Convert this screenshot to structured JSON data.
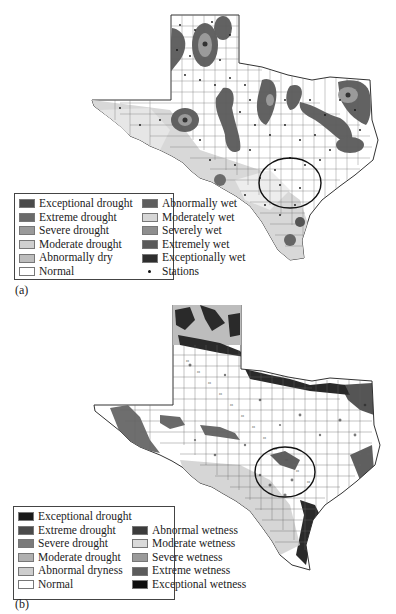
{
  "panel_a": {
    "caption": "(a)",
    "legend": {
      "left_column": [
        {
          "label": "Exceptional drought",
          "color": "#4a4a4a"
        },
        {
          "label": "Extreme drought",
          "color": "#6a6a6a"
        },
        {
          "label": "Severe drought",
          "color": "#9a9a9a"
        },
        {
          "label": "Moderate drought",
          "color": "#cfcfcf"
        },
        {
          "label": "Abnormally dry",
          "color": "#bdbdbd"
        },
        {
          "label": "Normal",
          "color": "#ffffff"
        }
      ],
      "right_column": [
        {
          "label": "Abnormally wet",
          "color": "#5e5e5e"
        },
        {
          "label": "Moderately wet",
          "color": "#d6d6d6"
        },
        {
          "label": "Severely wet",
          "color": "#8e8e8e"
        },
        {
          "label": "Extremely wet",
          "color": "#5a5a5a"
        },
        {
          "label": "Exceptionally wet",
          "color": "#2e2e2e"
        },
        {
          "label": "Stations",
          "symbol": "dot"
        }
      ]
    }
  },
  "panel_b": {
    "caption": "(b)",
    "legend": {
      "left_column": [
        {
          "label": "Exceptional drought",
          "color": "#1a1a1a"
        },
        {
          "label": "Extreme drought",
          "color": "#4a4a4a"
        },
        {
          "label": "Severe drought",
          "color": "#7a7a7a"
        },
        {
          "label": "Moderate drought",
          "color": "#b0b0b0"
        },
        {
          "label": "Abnormal dryness",
          "color": "#cdcdcd"
        },
        {
          "label": "Normal",
          "color": "#ffffff"
        }
      ],
      "right_column": [
        {
          "label": "Abnormal wetness",
          "color": "#3c3c3c"
        },
        {
          "label": "Moderate wetness",
          "color": "#dadada"
        },
        {
          "label": "Severe wetness",
          "color": "#9a9a9a"
        },
        {
          "label": "Extreme wetness",
          "color": "#5c5c5c"
        },
        {
          "label": "Exceptional wetness",
          "color": "#0e0e0e"
        }
      ]
    }
  }
}
